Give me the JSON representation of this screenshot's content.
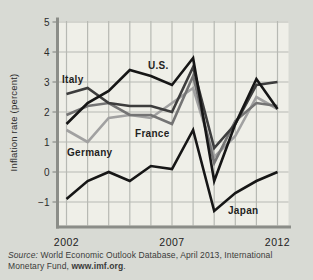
{
  "figure": {
    "bg_color": "#d8dad4"
  },
  "chart_data": {
    "type": "line",
    "title": "",
    "xlabel": "",
    "ylabel": "Inflation rate (percent)",
    "x": [
      2002,
      2003,
      2004,
      2005,
      2006,
      2007,
      2008,
      2009,
      2010,
      2011,
      2012
    ],
    "xticks": [
      {
        "year": 2002,
        "label": "2002"
      },
      {
        "year": 2007,
        "label": "2007"
      },
      {
        "year": 2012,
        "label": "2012"
      }
    ],
    "yticks": [
      5,
      4,
      3,
      2,
      1,
      0,
      -1
    ],
    "ytick_labels": [
      "5",
      "4",
      "3",
      "2",
      "1",
      "0",
      "−1"
    ],
    "xlim": [
      2002,
      2012
    ],
    "ylim": [
      -1.8,
      5
    ],
    "grid": true,
    "legend_position": "inline-labels",
    "colors": {
      "plot_bg": "#efefe8",
      "grid": "#b7b9b3",
      "axis": "#8b8d88"
    },
    "series": [
      {
        "name": "Germany",
        "color": "#a1a1a1",
        "values": [
          1.4,
          1.0,
          1.8,
          1.9,
          1.8,
          2.3,
          2.8,
          0.5,
          1.2,
          2.5,
          2.1
        ],
        "label_pos": [
          67,
          156
        ]
      },
      {
        "name": "France",
        "color": "#747474",
        "values": [
          1.9,
          2.2,
          2.3,
          1.9,
          1.9,
          1.6,
          3.2,
          0.3,
          1.7,
          2.3,
          2.2
        ],
        "label_pos": [
          135,
          137
        ]
      },
      {
        "name": "Italy",
        "color": "#3d3d3d",
        "values": [
          2.6,
          2.8,
          2.3,
          2.2,
          2.2,
          2.0,
          3.5,
          0.8,
          1.6,
          2.9,
          3.0
        ],
        "label_pos": [
          62,
          83
        ]
      },
      {
        "name": "U.S.",
        "color": "#161616",
        "values": [
          1.6,
          2.3,
          2.7,
          3.4,
          3.2,
          2.9,
          3.8,
          -0.3,
          1.6,
          3.1,
          2.1
        ],
        "label_pos": [
          148,
          69
        ]
      },
      {
        "name": "Japan",
        "color": "#161616",
        "values": [
          -0.9,
          -0.3,
          0.0,
          -0.3,
          0.2,
          0.1,
          1.4,
          -1.3,
          -0.7,
          -0.3,
          0.0
        ],
        "label_pos": [
          228,
          214
        ]
      }
    ]
  },
  "source": {
    "prefix": "Source:",
    "line1_rest": " World Economic Outlook Database, April 2013, International",
    "line2_pre": "Monetary Fund, ",
    "url": "www.imf.org",
    "suffix": "."
  }
}
